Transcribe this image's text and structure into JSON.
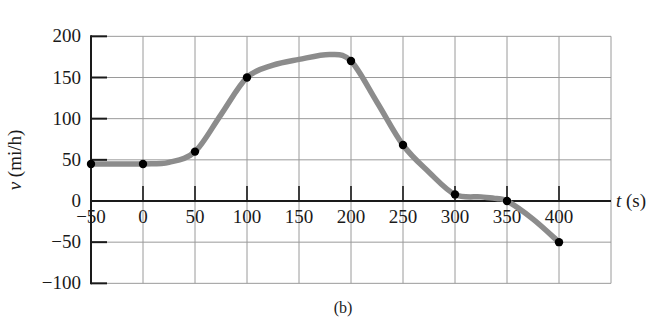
{
  "caption": "(b)",
  "chart_data": {
    "type": "line",
    "title": "",
    "xlabel": "t (s)",
    "ylabel": "v (mi/h)",
    "xlabel_var": "t",
    "xlabel_unit": "(s)",
    "ylabel_var": "v",
    "ylabel_unit": "(mi/h)",
    "xlim": [
      -50,
      450
    ],
    "ylim": [
      -100,
      200
    ],
    "x_ticks": [
      -50,
      0,
      50,
      100,
      150,
      200,
      250,
      300,
      350,
      400
    ],
    "y_ticks": [
      200,
      150,
      100,
      50,
      0,
      -50,
      -100
    ],
    "x_tick_labels": [
      "−50",
      "0",
      "50",
      "100",
      "150",
      "200",
      "250",
      "300",
      "350",
      "400"
    ],
    "y_tick_labels": [
      "200",
      "150",
      "100",
      "50",
      "0",
      "−50",
      "−100"
    ],
    "grid": true,
    "legend": null,
    "series": [
      {
        "name": "measured points",
        "marker": "filled-circle",
        "x": [
          -50,
          0,
          50,
          100,
          200,
          250,
          300,
          350,
          400
        ],
        "y": [
          45,
          45,
          60,
          150,
          170,
          68,
          8,
          0,
          -50
        ]
      },
      {
        "name": "smooth curve",
        "style": "thick gray line",
        "x": [
          -50,
          0,
          25,
          50,
          75,
          100,
          125,
          150,
          180,
          200,
          225,
          250,
          275,
          300,
          325,
          340,
          350,
          375,
          400
        ],
        "y": [
          45,
          45,
          47,
          60,
          105,
          150,
          165,
          172,
          178,
          170,
          120,
          68,
          35,
          8,
          5,
          3,
          0,
          -22,
          -50
        ]
      }
    ],
    "colors": {
      "curve": "#8c8c8c",
      "points": "#000000",
      "grid": "#9a9a9a",
      "axis": "#1a1a1a"
    }
  }
}
